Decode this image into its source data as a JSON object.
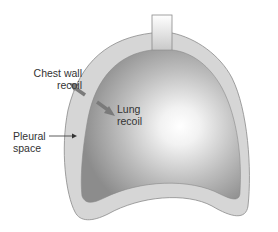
{
  "diagram": {
    "labels": {
      "chest_wall_recoil": [
        "Chest wall",
        "recoil"
      ],
      "lung_recoil": [
        "Lung",
        "recoil"
      ],
      "pleural_space": [
        "Pleural",
        "space"
      ]
    },
    "colors": {
      "chest_wall_fill": "#d6d6d6",
      "chest_wall_stroke": "#8a8a8a",
      "lung_center": "#ffffff",
      "lung_edge": "#8c8c8c",
      "arrow": "#7a7a7a",
      "text": "#333333"
    }
  }
}
